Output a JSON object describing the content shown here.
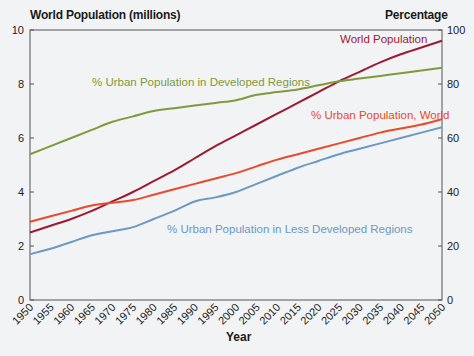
{
  "chart_data": {
    "type": "line",
    "title": "",
    "ylabel_left": "World Population (millions)",
    "ylabel_right": "Percentage",
    "xlabel": "Year",
    "x": [
      1950,
      1955,
      1960,
      1965,
      1970,
      1975,
      1980,
      1985,
      1990,
      1995,
      2000,
      2005,
      2010,
      2015,
      2020,
      2025,
      2030,
      2035,
      2040,
      2045,
      2050
    ],
    "x_tick_labels": [
      "1950",
      "1955",
      "1960",
      "1965",
      "1970",
      "1975",
      "1980",
      "1985",
      "1990",
      "1995",
      "2000",
      "2005",
      "2010",
      "2015",
      "2020",
      "2025",
      "2030",
      "2035",
      "2040",
      "2045",
      "2050"
    ],
    "ylim_left": [
      0,
      10
    ],
    "y_ticks_left": [
      0,
      2,
      4,
      6,
      8,
      10
    ],
    "ylim_right": [
      0,
      100
    ],
    "y_ticks_right": [
      0,
      20,
      40,
      60,
      80,
      100
    ],
    "grid": false,
    "legend_position": "inline annotations",
    "series": [
      {
        "name": "World Population",
        "axis": "left",
        "color": "#9b1b30",
        "values": [
          2.5,
          2.75,
          3.0,
          3.3,
          3.65,
          4.0,
          4.4,
          4.8,
          5.25,
          5.7,
          6.1,
          6.5,
          6.9,
          7.3,
          7.7,
          8.1,
          8.45,
          8.8,
          9.1,
          9.35,
          9.6
        ]
      },
      {
        "name": "% Urban Population in Developed Regions",
        "axis": "right",
        "color": "#7f9a3a",
        "values": [
          54,
          57,
          60,
          63,
          66,
          68,
          70,
          71,
          72,
          73,
          74,
          76,
          77,
          78,
          79.5,
          81,
          82,
          83,
          84,
          85,
          86
        ]
      },
      {
        "name": "% Urban Population, World",
        "axis": "right",
        "color": "#e84a2a",
        "values": [
          29,
          31,
          33,
          35,
          36,
          37,
          39,
          41,
          43,
          45,
          47,
          49.5,
          52,
          54,
          56,
          58,
          60,
          62,
          63.5,
          65,
          67
        ]
      },
      {
        "name": "% Urban Population in Less Developed Regions",
        "axis": "right",
        "color": "#6b99c4",
        "values": [
          17,
          19,
          21.5,
          24,
          25.5,
          27,
          30,
          33,
          36.5,
          38,
          40,
          43,
          46,
          49,
          51.5,
          54,
          56,
          58,
          60,
          62,
          64
        ]
      }
    ]
  },
  "labels": {
    "left_axis_title": "World Population (millions)",
    "right_axis_title": "Percentage",
    "x_axis_title": "Year",
    "annotations": {
      "world_population": "World Population",
      "urban_developed": "% Urban Population in Developed Regions",
      "urban_world": "% Urban Population, World",
      "urban_less_developed": "% Urban Population in Less Developed Regions"
    }
  }
}
